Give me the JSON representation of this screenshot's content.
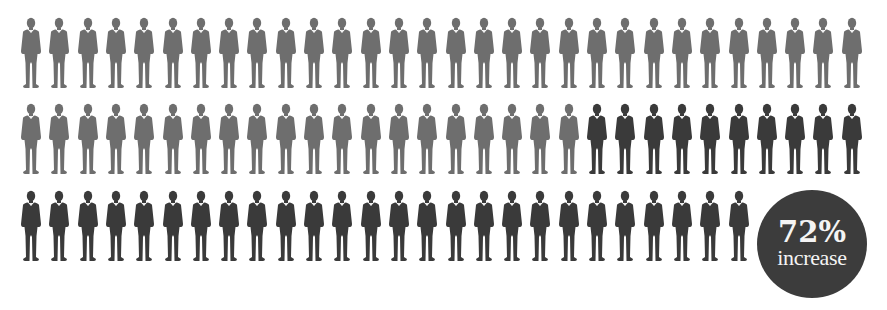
{
  "chart_data": {
    "type": "pictogram",
    "title": "",
    "unit_icon": "businessman-icon",
    "rows": 3,
    "row_counts": [
      30,
      30,
      26
    ],
    "series": [
      {
        "name": "baseline",
        "count": 50,
        "color": "#6e6e6e"
      },
      {
        "name": "increase",
        "count": 36,
        "color": "#3a3a3a"
      }
    ],
    "total_figures": 86,
    "annotation": {
      "value": "72%",
      "label": "increase"
    }
  },
  "layout": {
    "start_x": 19,
    "spacing_x": 28.3,
    "row_tops": [
      17,
      103,
      190
    ]
  },
  "badge": {
    "value": "72%",
    "label": "increase",
    "color": "#3c3c3c"
  }
}
